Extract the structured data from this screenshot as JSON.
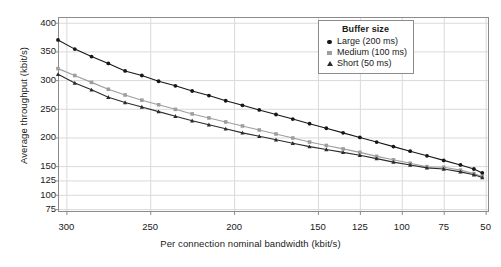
{
  "chart_data": {
    "type": "line",
    "title": "",
    "xlabel": "Per connection nominal bandwidth (kbit/s)",
    "ylabel": "Average throughput (kbit/s)",
    "xlim": [
      305,
      48
    ],
    "ylim": [
      70,
      410
    ],
    "x_reversed": true,
    "grid": true,
    "legend_position": "top-right",
    "legend_title": "Buffer size",
    "xticks": [
      300,
      250,
      200,
      150,
      125,
      100,
      75,
      50
    ],
    "xticklabels": [
      "300",
      "250",
      "200",
      "150",
      "125",
      "100",
      "75",
      "50"
    ],
    "yticks": [
      400,
      350,
      300,
      250,
      200,
      150,
      125,
      100,
      75
    ],
    "yticklabels": [
      "400",
      "350",
      "300",
      "250",
      "200",
      "150",
      "125",
      "100",
      "75"
    ],
    "x": [
      305,
      295,
      285,
      275,
      265,
      255,
      245,
      235,
      225,
      215,
      205,
      195,
      185,
      175,
      165,
      155,
      145,
      135,
      125,
      115,
      105,
      95,
      85,
      75,
      65,
      57,
      52
    ],
    "series": [
      {
        "name": "Large (200 ms)",
        "label": "Large (200 ms)",
        "color": "#161616",
        "marker": "circle",
        "values": [
          370,
          354,
          341,
          329,
          316,
          308,
          298,
          290,
          281,
          273,
          264,
          256,
          248,
          240,
          232,
          224,
          216,
          208,
          200,
          192,
          184,
          176,
          168,
          160,
          152,
          145,
          138
        ]
      },
      {
        "name": "Medium (100 ms)",
        "label": "Medium (100 ms)",
        "color": "#9e9e9e",
        "marker": "square",
        "values": [
          320,
          308,
          296,
          284,
          274,
          265,
          257,
          249,
          241,
          234,
          227,
          220,
          213,
          206,
          199,
          192,
          186,
          180,
          174,
          167,
          161,
          155,
          149,
          148,
          143,
          137,
          132
        ]
      },
      {
        "name": "Short (50 ms)",
        "label": "Short (50 ms)",
        "color": "#2b2b2b",
        "marker": "triangle",
        "values": [
          310,
          295,
          283,
          270,
          261,
          253,
          245,
          237,
          229,
          222,
          215,
          208,
          202,
          196,
          190,
          184,
          179,
          174,
          169,
          163,
          157,
          152,
          147,
          145,
          140,
          135,
          130
        ]
      }
    ],
    "style": {
      "plot_bg": "#ffffff",
      "grid_color": "#d9d9d9",
      "axis_color": "#8c8c8c",
      "text_color": "#1a1a1a"
    }
  }
}
